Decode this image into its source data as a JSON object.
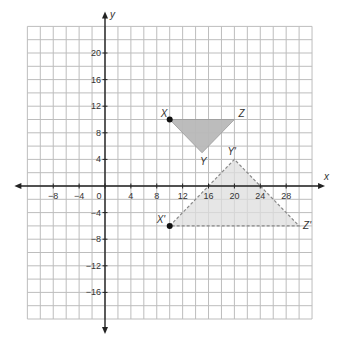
{
  "chart_data": {
    "type": "scatter",
    "title": "",
    "xlabel": "x",
    "ylabel": "y",
    "xlim": [
      -12,
      32
    ],
    "ylim": [
      -20,
      24
    ],
    "grid": true,
    "grid_step": 2,
    "x_ticks": [
      -8,
      -4,
      0,
      4,
      8,
      12,
      16,
      20,
      24,
      28
    ],
    "y_ticks": [
      20,
      16,
      12,
      8,
      4,
      -4,
      -8,
      -12,
      -16
    ],
    "series": [
      {
        "name": "Triangle XYZ",
        "style": "solid",
        "fill": "#b8b8b8",
        "points": [
          {
            "label": "X",
            "x": 10,
            "y": 10
          },
          {
            "label": "Y",
            "x": 15,
            "y": 5
          },
          {
            "label": "Z",
            "x": 20,
            "y": 10
          }
        ]
      },
      {
        "name": "Triangle X'Y'Z'",
        "style": "dashed",
        "fill": "#dddddd",
        "points": [
          {
            "label": "X'",
            "x": 10,
            "y": -6
          },
          {
            "label": "Y'",
            "x": 20,
            "y": 4
          },
          {
            "label": "Z'",
            "x": 30,
            "y": -6
          }
        ]
      }
    ],
    "marked_points": [
      {
        "label": "X",
        "x": 10,
        "y": 10
      },
      {
        "label": "X'",
        "x": 10,
        "y": -6
      }
    ]
  },
  "colors": {
    "grid": "#bdbdbd",
    "axis": "#222222",
    "original_fill": "#b8b8b8",
    "image_fill": "#dddddd",
    "image_stroke": "#888888"
  }
}
